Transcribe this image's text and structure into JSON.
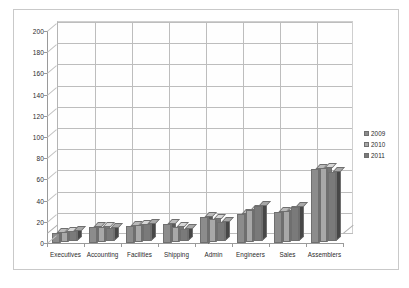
{
  "chart_data": {
    "type": "bar",
    "title": "",
    "subtitle": "",
    "xlabel": "",
    "ylabel": "",
    "ylim": [
      0,
      200
    ],
    "ytick_step": 20,
    "yticks": [
      "0",
      "20",
      "40",
      "60",
      "80",
      "100",
      "120",
      "140",
      "160",
      "180",
      "200"
    ],
    "grid": "horizontal-and-vertical",
    "legend_position": "right",
    "style": "3d-clustered-column-grayscale",
    "categories": [
      "Executives",
      "Accounting",
      "Facilities",
      "Shipping",
      "Admin",
      "Engineers",
      "Sales",
      "Assemblers"
    ],
    "series": [
      {
        "name": "2009",
        "color": "#8c8c8c",
        "values": [
          9,
          15,
          16,
          18,
          25,
          27,
          29,
          70
        ]
      },
      {
        "name": "2010",
        "color": "#a8a8a8",
        "values": [
          9,
          14,
          16,
          14,
          22,
          30,
          29,
          70
        ]
      },
      {
        "name": "2011",
        "color": "#7a7a7a",
        "values": [
          9,
          12,
          16,
          11,
          18,
          33,
          32,
          65
        ]
      }
    ]
  },
  "legend": {
    "entries": [
      {
        "label": "2009",
        "color": "#8c8c8c"
      },
      {
        "label": "2010",
        "color": "#a8a8a8"
      },
      {
        "label": "2011",
        "color": "#7a7a7a"
      }
    ]
  },
  "colors": {
    "background": "#ffffff",
    "frame_border": "#c9c9c9",
    "gridline": "#bdbdbd",
    "axis_line": "#9a9a9a",
    "text": "#2a2a2a",
    "bar_outline": "#6f6f6f"
  }
}
